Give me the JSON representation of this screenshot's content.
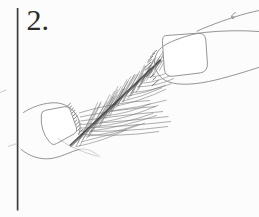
{
  "page": {
    "width": 259,
    "height": 217,
    "background": "#fcfcfc"
  },
  "figure": {
    "label": "2."
  },
  "colors": {
    "paper": "#fcfcfc",
    "ink": "#2b2b2b",
    "rule": "#3c3c3c",
    "outline": "#8f8f8f",
    "shaft": "#404040",
    "barb": "#5f5f5f",
    "fan": "#757575",
    "root": "#4a4a4a"
  },
  "illustration": {
    "subject": "two-fingertips-stretching-fibrous-strands",
    "parts": [
      "upper-finger",
      "lower-finger",
      "strand-bundle"
    ]
  }
}
